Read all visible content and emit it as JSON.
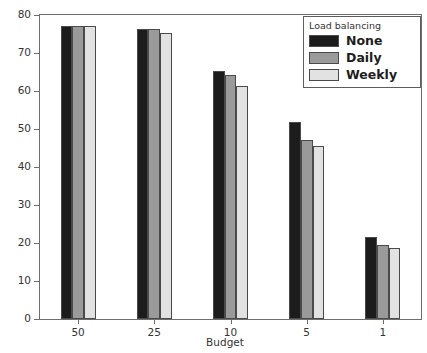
{
  "chart_data": {
    "type": "bar",
    "title": "",
    "xlabel": "Budget",
    "ylabel": "Accuracy percentage (100% = 2124 tweets)",
    "categories": [
      "50",
      "25",
      "10",
      "5",
      "1"
    ],
    "series": [
      {
        "name": "None",
        "color": "#1c1c1c",
        "values": [
          77.0,
          76.4,
          65.3,
          51.8,
          21.5
        ]
      },
      {
        "name": "Daily",
        "color": "#9a9a9a",
        "values": [
          77.0,
          76.4,
          64.2,
          47.1,
          19.5
        ]
      },
      {
        "name": "Weekly",
        "color": "#e2e2e2",
        "values": [
          77.0,
          75.3,
          61.4,
          45.4,
          18.8
        ]
      }
    ],
    "ylim": [
      0,
      80
    ],
    "yticks": [
      0,
      10,
      20,
      30,
      40,
      50,
      60,
      70,
      80
    ],
    "ytick_labels": [
      "0",
      "10",
      "20",
      "30",
      "40",
      "50",
      "60",
      "70",
      "80"
    ],
    "grid": false,
    "legend": {
      "title": "Load balancing",
      "position": "upper right",
      "entries": [
        "None",
        "Daily",
        "Weekly"
      ]
    }
  }
}
